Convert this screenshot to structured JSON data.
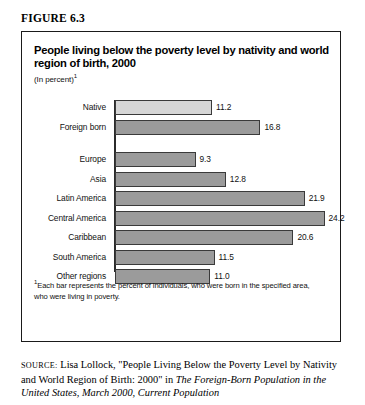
{
  "figure": {
    "label": "FIGURE 6.3"
  },
  "chart_panel": {
    "title": "People living below the poverty level by nativity and world region of birth, 2000",
    "subtitle": "(In percent)",
    "subtitle_superscript": "1",
    "footnote_superscript": "1",
    "footnote": "Each bar represents the percent of individuals, who were born in the specified area, who were living in poverty."
  },
  "chart_data": {
    "type": "bar",
    "orientation": "horizontal",
    "title": "People living below the poverty level by nativity and world region of birth, 2000",
    "subtitle": "(In percent)",
    "xlabel": "",
    "ylabel": "",
    "xlim": [
      0,
      26
    ],
    "grid": false,
    "legend": "none",
    "value_format": "one-decimal",
    "groups": [
      {
        "name": "Nativity",
        "categories": [
          "Native",
          "Foreign born"
        ],
        "values": [
          11.2,
          16.8
        ]
      },
      {
        "name": "World region of birth",
        "categories": [
          "Europe",
          "Asia",
          "Latin America",
          "Central America",
          "Caribbean",
          "South America",
          "Other regions"
        ],
        "values": [
          9.3,
          12.8,
          21.9,
          24.2,
          20.6,
          11.5,
          11.0
        ]
      }
    ],
    "categories": [
      "Native",
      "Foreign born",
      "Europe",
      "Asia",
      "Latin America",
      "Central America",
      "Caribbean",
      "South America",
      "Other regions"
    ],
    "values": [
      11.2,
      16.8,
      9.3,
      12.8,
      21.9,
      24.2,
      20.6,
      11.5,
      11.0
    ],
    "bars": [
      {
        "label": "Native",
        "value": 11.2,
        "value_text": "11.2",
        "shade": "light",
        "indent": 0,
        "group": 0
      },
      {
        "label": "Foreign born",
        "value": 16.8,
        "value_text": "16.8",
        "shade": "dark",
        "indent": 0,
        "group": 0
      },
      {
        "label": "Europe",
        "value": 9.3,
        "value_text": "9.3",
        "shade": "dark",
        "indent": 0,
        "group": 1
      },
      {
        "label": "Asia",
        "value": 12.8,
        "value_text": "12.8",
        "shade": "dark",
        "indent": 0,
        "group": 1
      },
      {
        "label": "Latin America",
        "value": 21.9,
        "value_text": "21.9",
        "shade": "dark",
        "indent": 0,
        "group": 1
      },
      {
        "label": "Central America",
        "value": 24.2,
        "value_text": "24.2",
        "shade": "dark",
        "indent": 1,
        "group": 1
      },
      {
        "label": "Caribbean",
        "value": 20.6,
        "value_text": "20.6",
        "shade": "dark",
        "indent": 1,
        "group": 1
      },
      {
        "label": "South America",
        "value": 11.5,
        "value_text": "11.5",
        "shade": "dark",
        "indent": 1,
        "group": 1
      },
      {
        "label": "Other regions",
        "value": 11.0,
        "value_text": "11.0",
        "shade": "dark",
        "indent": 0,
        "group": 1
      }
    ],
    "colors": {
      "bar_light": "#d6d6d6",
      "bar_dark": "#9b9b9b",
      "bar_outline": "#3a3a3a",
      "axis": "#2b2b2b",
      "text": "#111111"
    }
  },
  "source": {
    "prefix": "SOURCE:",
    "line1_plain": " Lisa Lollock, \"People Living Below the Poverty Level by",
    "line2_plain": "Nativity and World Region of Birth: 2000\" in ",
    "line2_italic": "The Foreign-Born",
    "line3_italic": "Population in the United States, March 2000, Current Population"
  }
}
